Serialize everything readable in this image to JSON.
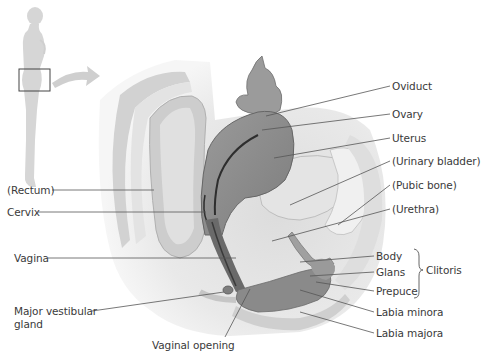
{
  "figure": {
    "type": "anatomical-diagram",
    "locator_inset": {
      "description": "standing female silhouette with box over pelvis and curved arrow pointing to section"
    },
    "colors": {
      "background": "#ffffff",
      "silhouette": "#d6d6d6",
      "tissue_light": "#e8e8e8",
      "tissue_mid": "#c4c4c4",
      "tissue_dark": "#8a8a8a",
      "uterus": "#8f8f8f",
      "canal": "#3c3c3c",
      "leader_line": "#555555",
      "text": "#3a3a3a"
    }
  },
  "labels": {
    "right": [
      {
        "id": "oviduct",
        "text": "Oviduct"
      },
      {
        "id": "ovary",
        "text": "Ovary"
      },
      {
        "id": "uterus",
        "text": "Uterus"
      },
      {
        "id": "urinary_bladder",
        "text": "(Urinary bladder)"
      },
      {
        "id": "pubic_bone",
        "text": "(Pubic bone)"
      },
      {
        "id": "urethra",
        "text": "(Urethra)"
      },
      {
        "id": "body",
        "text": "Body"
      },
      {
        "id": "glans",
        "text": "Glans"
      },
      {
        "id": "prepuce",
        "text": "Prepuce"
      },
      {
        "id": "labia_minora",
        "text": "Labia minora"
      },
      {
        "id": "labia_majora",
        "text": "Labia majora"
      }
    ],
    "left": [
      {
        "id": "rectum",
        "text": "(Rectum)"
      },
      {
        "id": "cervix",
        "text": "Cervix"
      },
      {
        "id": "vagina",
        "text": "Vagina"
      },
      {
        "id": "major_vestibular_gland_1",
        "text": "Major vestibular"
      },
      {
        "id": "major_vestibular_gland_2",
        "text": "gland"
      }
    ],
    "bottom": [
      {
        "id": "vaginal_opening",
        "text": "Vaginal opening"
      }
    ],
    "group": {
      "id": "clitoris",
      "text": "Clitoris",
      "members": [
        "Body",
        "Glans",
        "Prepuce"
      ]
    }
  }
}
